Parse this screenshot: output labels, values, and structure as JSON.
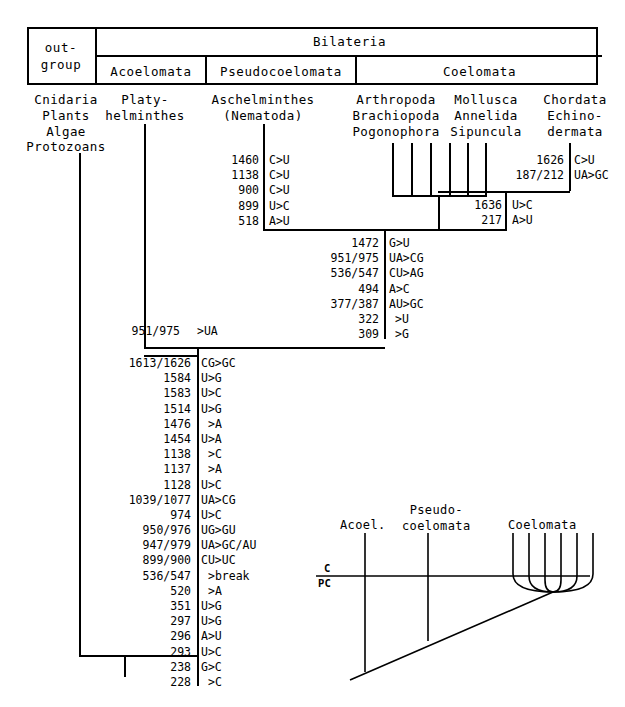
{
  "header_table": {
    "outgroup": "out-\ngroup",
    "bilateria": "Bilateria",
    "subgroups": [
      "Acoelomata",
      "Pseudocoelomata",
      "Coelomata"
    ]
  },
  "taxa": {
    "outgroup_list": "Cnidaria\nPlants\nAlgae\nProtozoans",
    "acoelomata_list": "Platy-\nhelminthes",
    "pseudocoelomata_list": "Aschelminthes\n(Nematoda)",
    "coelomata_group1": "Arthropoda\nBrachiopoda\nPogonophora",
    "coelomata_group2": "Mollusca\nAnnelida\nSipuncula",
    "coelomata_group3": "Chordata\nEchino-\ndermata"
  },
  "mutations": {
    "aschelminthes": {
      "label": "Aschelminthes branch mutations",
      "rows": [
        {
          "position": "1460",
          "change": "C>U"
        },
        {
          "position": "1138",
          "change": "C>U"
        },
        {
          "position": "900",
          "change": "C>U"
        },
        {
          "position": "899",
          "change": "U>C"
        },
        {
          "position": "518",
          "change": "A>U"
        }
      ]
    },
    "chordata_echinodermata": {
      "label": "Chordata/Echinodermata branch mutations",
      "rows": [
        {
          "position": "1626",
          "change": "C>U"
        },
        {
          "position": "187/212",
          "change": "UA>GC"
        }
      ]
    },
    "coelomata": {
      "label": "Coelomata node mutations",
      "rows": [
        {
          "position": "1636",
          "change": "U>C"
        },
        {
          "position": "217",
          "change": "A>U"
        }
      ]
    },
    "bilateria": {
      "label": "Bilateria node mutations",
      "rows": [
        {
          "position": "1472",
          "change": "G>U"
        },
        {
          "position": "951/975",
          "change": "UA>CG"
        },
        {
          "position": "536/547",
          "change": "CU>AG"
        },
        {
          "position": "494",
          "change": "A>C"
        },
        {
          "position": "377/387",
          "change": "AU>GC"
        },
        {
          "position": "322",
          "change": ">U"
        },
        {
          "position": "309",
          "change": ">G"
        }
      ]
    },
    "platyhelminthes": {
      "label": "Platyhelminthes branch mutation",
      "rows": [
        {
          "position": "951/975",
          "change": ">UA"
        }
      ]
    },
    "root": {
      "label": "Root / ancestral node mutations",
      "rows": [
        {
          "position": "1613/1626",
          "change": "CG>GC"
        },
        {
          "position": "1584",
          "change": "U>G"
        },
        {
          "position": "1583",
          "change": "U>C"
        },
        {
          "position": "1514",
          "change": "U>G"
        },
        {
          "position": "1476",
          "change": ">A"
        },
        {
          "position": "1454",
          "change": "U>A"
        },
        {
          "position": "1138",
          "change": ">C"
        },
        {
          "position": "1137",
          "change": ">A"
        },
        {
          "position": "1128",
          "change": "U>C"
        },
        {
          "position": "1039/1077",
          "change": "UA>CG"
        },
        {
          "position": "974",
          "change": "U>C"
        },
        {
          "position": "950/976",
          "change": "UG>GU"
        },
        {
          "position": "947/979",
          "change": "UA>GC/AU"
        },
        {
          "position": "899/900",
          "change": "CU>UC"
        },
        {
          "position": "536/547",
          "change": ">break"
        },
        {
          "position": "520",
          "change": ">A"
        },
        {
          "position": "351",
          "change": "U>G"
        },
        {
          "position": "297",
          "change": "U>G"
        },
        {
          "position": "296",
          "change": "A>U"
        },
        {
          "position": "293",
          "change": "U>C"
        },
        {
          "position": "238",
          "change": "G>C"
        },
        {
          "position": "228",
          "change": ">C"
        }
      ]
    }
  },
  "inset": {
    "label": "Time-calibrated divergence inset",
    "branch_labels": [
      "Acoel.",
      "Pseudo-\ncoelomata",
      "Coelomata"
    ],
    "era_upper": "C",
    "era_lower": "PC"
  },
  "colors": {
    "ink": "#000000",
    "background": "#ffffff"
  }
}
